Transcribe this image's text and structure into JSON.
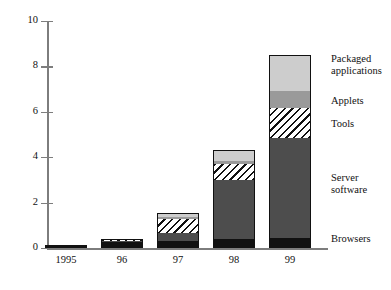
{
  "chart_data": {
    "type": "bar",
    "subtype": "stacked-bar",
    "title": "",
    "xlabel": "",
    "ylabel": "",
    "categories": [
      "1995",
      "96",
      "97",
      "98",
      "99"
    ],
    "ylim": [
      0,
      10
    ],
    "yticks": [
      0,
      2,
      4,
      6,
      8,
      10
    ],
    "ytick_labels": [
      "0",
      "2",
      "4",
      "6",
      "8",
      "10"
    ],
    "grid": false,
    "legend_position": "right-inline",
    "series": [
      {
        "name": "Browsers",
        "fill": "solid-black",
        "color": "#111111",
        "values": [
          0.15,
          0.25,
          0.3,
          0.4,
          0.45
        ]
      },
      {
        "name": "Server software",
        "fill": "solid-dark-gray",
        "color": "#4d4d4d",
        "values": [
          0,
          0.05,
          0.35,
          2.6,
          4.4
        ]
      },
      {
        "name": "Tools",
        "fill": "diagonal-hatch",
        "color": "#ffffff",
        "values": [
          0,
          0.05,
          0.65,
          0.7,
          1.3
        ]
      },
      {
        "name": "Applets",
        "fill": "solid-medium-gray",
        "color": "#9a9a9a",
        "values": [
          0,
          0.02,
          0.05,
          0.12,
          0.75
        ]
      },
      {
        "name": "Packaged applications",
        "fill": "solid-light-gray",
        "color": "#cdcdcd",
        "values": [
          0,
          0.03,
          0.2,
          0.5,
          1.6
        ]
      }
    ],
    "totals": [
      0.15,
      0.4,
      1.55,
      4.32,
      8.5
    ],
    "annotations": []
  },
  "axes": {
    "y_ticks": [
      {
        "value": "10"
      },
      {
        "value": "8"
      },
      {
        "value": "6"
      },
      {
        "value": "4"
      },
      {
        "value": "2"
      },
      {
        "value": "0"
      }
    ],
    "x_ticks": [
      {
        "label": "1995"
      },
      {
        "label": "96"
      },
      {
        "label": "97"
      },
      {
        "label": "98"
      },
      {
        "label": "99"
      }
    ]
  },
  "legend": {
    "items": [
      {
        "label": "Packaged\napplications"
      },
      {
        "label": "Applets"
      },
      {
        "label": "Tools"
      },
      {
        "label": "Server\nsoftware"
      },
      {
        "label": "Browsers"
      }
    ]
  }
}
